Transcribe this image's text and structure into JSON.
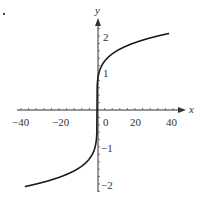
{
  "chart_data": {
    "type": "line",
    "title": "",
    "function": "y = x^(1/5)",
    "xlabel": "x",
    "ylabel": "y",
    "xlim": [
      -40,
      46
    ],
    "ylim": [
      -2.3,
      2.5
    ],
    "x_ticks": [
      -40,
      -20,
      0,
      20,
      40
    ],
    "x_tick_labels": [
      "−40",
      "−20",
      "0",
      "20",
      "40"
    ],
    "y_ticks": [
      -2,
      -1,
      1,
      2
    ],
    "y_tick_labels": [
      "−2",
      "−1",
      "1",
      "2"
    ],
    "grid": false,
    "series": [
      {
        "name": "y = x^(1/5)",
        "x": [
          -38,
          -30,
          -20,
          -10,
          -5,
          -2,
          -1,
          -0.1,
          0,
          0.1,
          1,
          2,
          5,
          10,
          20,
          30,
          38
        ],
        "values": [
          -2.07,
          -1.97,
          -1.82,
          -1.58,
          -1.38,
          -1.15,
          -1.0,
          -0.63,
          0,
          0.63,
          1.0,
          1.15,
          1.38,
          1.58,
          1.82,
          1.97,
          2.07
        ]
      }
    ]
  },
  "labels": {
    "x_axis": "x",
    "y_axis": "y",
    "xt0": "−40",
    "xt1": "−20",
    "xt2": "0",
    "xt3": "20",
    "xt4": "40",
    "yt0": "2",
    "yt1": "1",
    "yt2": "−1",
    "yt3": "−2"
  },
  "colors": {
    "axis": "#333333",
    "curve": "#1a1a1a"
  }
}
